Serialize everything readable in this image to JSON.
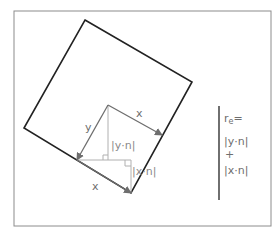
{
  "diagram": {
    "frame": {
      "x": 14,
      "y": 11,
      "w": 257,
      "h": 215,
      "stroke": "#8c8c8c"
    },
    "square": {
      "points": "85,20 192,82 131,193 24,128",
      "stroke": "#222222"
    },
    "vectors": {
      "origin": [
        108,
        105
      ],
      "x_vector": {
        "label": "x",
        "to": [
          162,
          135
        ]
      },
      "y_vector": {
        "label": "y",
        "to": [
          77,
          160
        ]
      },
      "x_vector_bottom": {
        "label": "x",
        "from": [
          77,
          160
        ],
        "to": [
          131,
          193
        ]
      },
      "arrow_color": "#6e6e6e"
    },
    "projections": {
      "y_dot_n_label": "|y·n|",
      "x_dot_n_label": "|x·n|",
      "color": "#b0b0b0"
    },
    "formula": {
      "lhs": "r",
      "lhs_sub": "e",
      "equals": "=",
      "term1": "|y·n|",
      "plus": "+",
      "term2": "|x·n|"
    }
  }
}
